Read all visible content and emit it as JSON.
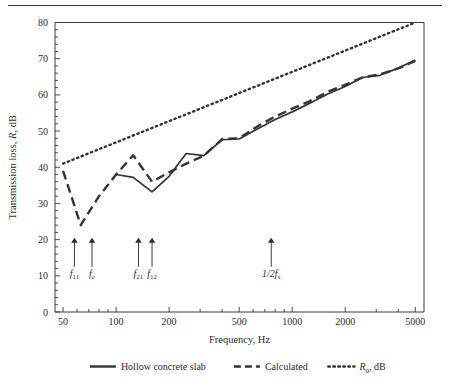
{
  "figure": {
    "top_rule": true
  },
  "chart_data": {
    "type": "line",
    "title": "",
    "xlabel": "Frequency, Hz",
    "ylabel": "Transmission loss, R, dB",
    "xscale": "log",
    "xlim": [
      45,
      5600
    ],
    "ylim": [
      0,
      80
    ],
    "yticks": [
      0,
      10,
      20,
      30,
      40,
      50,
      60,
      70,
      80
    ],
    "ytick_labels": [
      "0",
      "10",
      "20",
      "30",
      "40",
      "50",
      "60",
      "70",
      "80"
    ],
    "ytick_minor_step": 2,
    "xticks": [
      50,
      100,
      200,
      500,
      1000,
      2000,
      5000
    ],
    "xtick_labels": [
      "50",
      "100",
      "200",
      "500",
      "1000",
      "2000",
      "5000"
    ],
    "grid": false,
    "legend_position": "below",
    "series": [
      {
        "name": "Hollow concrete slab",
        "style": "solid",
        "color": "#333333",
        "x": [
          100,
          125,
          160,
          200,
          250,
          315,
          400,
          500,
          630,
          800,
          1000,
          1250,
          1600,
          2000,
          2500,
          3150,
          4000,
          5000
        ],
        "y": [
          38.0,
          37.2,
          33.2,
          37.5,
          43.8,
          43.2,
          47.6,
          47.8,
          50.5,
          53.2,
          55.3,
          57.6,
          60.3,
          62.3,
          64.8,
          65.4,
          67.4,
          69.6
        ]
      },
      {
        "name": "Calculated",
        "style": "dashed",
        "color": "#333333",
        "x": [
          50,
          63,
          80,
          100,
          125,
          160,
          200,
          250,
          315,
          400,
          500,
          630,
          800,
          1000,
          1250,
          1600,
          2000,
          2500,
          3150,
          4000,
          5000
        ],
        "y": [
          39.0,
          24.0,
          32.0,
          38.0,
          43.3,
          36.0,
          38.6,
          41.0,
          43.2,
          47.8,
          48.0,
          51.2,
          54.0,
          56.2,
          58.2,
          60.9,
          62.8,
          64.8,
          65.7,
          67.3,
          69.4
        ]
      },
      {
        "name": "R_0, dB",
        "style": "dotted",
        "color": "#333333",
        "x": [
          50,
          5000
        ],
        "y": [
          41.0,
          80.0
        ]
      }
    ],
    "annotations": [
      {
        "label": "f11",
        "base": "f",
        "sub": "11",
        "freq": 58,
        "arrow_top_db": 20.5,
        "arrow_bottom_db": 12.5
      },
      {
        "label": "fc",
        "base": "f",
        "sub": "c",
        "freq": 73,
        "arrow_top_db": 20.5,
        "arrow_bottom_db": 12.5
      },
      {
        "label": "f21",
        "base": "f",
        "sub": "21",
        "freq": 134,
        "arrow_top_db": 20.5,
        "arrow_bottom_db": 12.5
      },
      {
        "label": "f12",
        "base": "f",
        "sub": "12",
        "freq": 160,
        "arrow_top_db": 20.5,
        "arrow_bottom_db": 12.5
      },
      {
        "label": "1/2fs",
        "base": "1/2f",
        "sub": "s",
        "freq": 760,
        "arrow_top_db": 20.5,
        "arrow_bottom_db": 12.5
      }
    ]
  },
  "legend": {
    "items": [
      {
        "label": "Hollow concrete slab",
        "style": "solid"
      },
      {
        "label": "Calculated",
        "style": "dashed"
      },
      {
        "label": "R",
        "sub": "0",
        "tail": ", dB",
        "style": "dotted"
      }
    ]
  }
}
